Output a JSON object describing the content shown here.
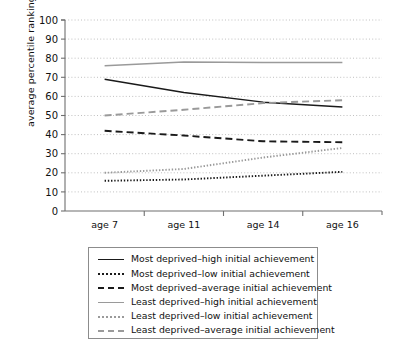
{
  "chart_data": {
    "type": "line",
    "title": "",
    "xlabel": "",
    "ylabel": "average percentile ranking",
    "categories": [
      "age 7",
      "age 11",
      "age 14",
      "age 16"
    ],
    "ylim": [
      0,
      100
    ],
    "ytick_labels": [
      "0",
      "10",
      "20",
      "30",
      "40",
      "50",
      "60",
      "70",
      "80",
      "90",
      "100"
    ],
    "ytick_values": [
      0,
      10,
      20,
      30,
      40,
      50,
      60,
      70,
      80,
      90,
      100
    ],
    "grid": "horizontal-dotted",
    "legend_position": "below-chart",
    "series": [
      {
        "name": "Most deprived–high initial achievement",
        "style": "solid",
        "color": "#1a1a1a",
        "values": [
          69,
          62,
          57,
          54.5
        ]
      },
      {
        "name": "Most deprived–low initial achievement",
        "style": "dotted",
        "color": "#1a1a1a",
        "values": [
          15.8,
          16.5,
          18.5,
          20.5
        ]
      },
      {
        "name": "Most deprived–average initial achievement",
        "style": "dashed",
        "color": "#1a1a1a",
        "values": [
          42,
          39.5,
          36.5,
          36
        ]
      },
      {
        "name": "Least deprived–high initial achievement",
        "style": "solid",
        "color": "#9a9a9a",
        "values": [
          76,
          78,
          77.8,
          77.8
        ]
      },
      {
        "name": "Least deprived–low initial achievement",
        "style": "dotted",
        "color": "#9a9a9a",
        "values": [
          20,
          22,
          28,
          33
        ]
      },
      {
        "name": "Least deprived–average initial achievement",
        "style": "dashed",
        "color": "#9a9a9a",
        "values": [
          50,
          53,
          56.5,
          58
        ]
      }
    ]
  },
  "legend": {
    "items": [
      {
        "label": "Most deprived–high initial achievement"
      },
      {
        "label": "Most deprived–low initial achievement"
      },
      {
        "label": "Most deprived–average initial achievement"
      },
      {
        "label": "Least deprived–high initial achievement"
      },
      {
        "label": "Least deprived–low initial achievement"
      },
      {
        "label": "Least deprived–average initial achievement"
      }
    ]
  },
  "colors": {
    "most_deprived": "#1a1a1a",
    "least_deprived": "#9a9a9a",
    "gridline": "#b9b9b9",
    "axis": "#6f6f6f"
  }
}
